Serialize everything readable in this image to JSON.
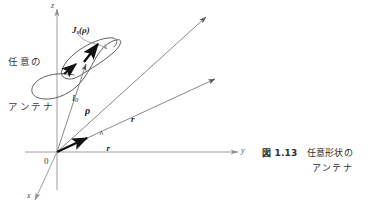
{
  "figure": {
    "axes": {
      "z_label": "z",
      "y_label": "y",
      "x_label": "x",
      "origin_label": "0"
    },
    "annotations": {
      "antenna_note_line1": "任意の",
      "antenna_note_line2": "アンテナ",
      "surface_current": "J",
      "surface_current_sub": "s",
      "surface_current_arg": "(ρ)",
      "current_label": "I",
      "current_sub": "0",
      "rho_label": "ρ",
      "r_hat_label": "r",
      "r_hat_mark": "^",
      "r_label": "r"
    },
    "caption": {
      "number": "図 1.13",
      "line1": "任意形状の",
      "line2": "アンテナ"
    },
    "colors": {
      "axis": "#999999",
      "ray": "#6e6e6e",
      "outline": "#4a4a4a",
      "bold_arrow": "#111111",
      "text": "#2e2e2e",
      "background": "#ffffff"
    }
  }
}
